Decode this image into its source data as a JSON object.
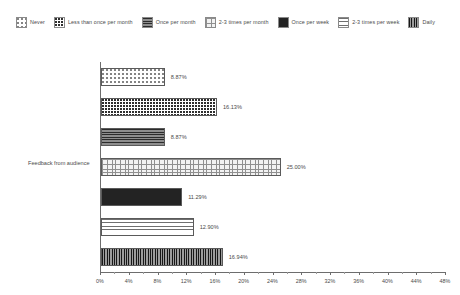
{
  "chart_data": {
    "type": "bar",
    "orientation": "horizontal",
    "title": "",
    "xlabel": "",
    "ylabel": "",
    "categories": [
      "Feedback from audience"
    ],
    "xlim": [
      0,
      48
    ],
    "xticks": [
      "0%",
      "4%",
      "8%",
      "12%",
      "16%",
      "20%",
      "24%",
      "28%",
      "32%",
      "36%",
      "40%",
      "44%",
      "48%"
    ],
    "xtick_values": [
      0,
      4,
      8,
      12,
      16,
      20,
      24,
      28,
      32,
      36,
      40,
      44,
      48
    ],
    "grid": false,
    "legend_position": "top",
    "series": [
      {
        "name": "Never",
        "values": [
          8.87
        ],
        "label": "8.87%",
        "pattern": "sparse-dots"
      },
      {
        "name": "Less than once per month",
        "values": [
          16.13
        ],
        "label": "16.13%",
        "pattern": "dense-dots"
      },
      {
        "name": "Once per month",
        "values": [
          8.87
        ],
        "label": "8.87%",
        "pattern": "dark-horizontal-lines"
      },
      {
        "name": "2-3 times per month",
        "values": [
          25.0
        ],
        "label": "25.00%",
        "pattern": "light-crosshatch"
      },
      {
        "name": "Once per week",
        "values": [
          11.29
        ],
        "label": "11.29%",
        "pattern": "dark-solid-speckle"
      },
      {
        "name": "2-3 times per week",
        "values": [
          12.9
        ],
        "label": "12.90%",
        "pattern": "light-horizontal-lines"
      },
      {
        "name": "Daily",
        "values": [
          16.94
        ],
        "label": "16.94%",
        "pattern": "dark-grid"
      }
    ]
  },
  "legend": {
    "items": [
      {
        "label": "Never",
        "swatch": "sparse-dots-swatch"
      },
      {
        "label": "Less than once per month",
        "swatch": "dense-dots-swatch"
      },
      {
        "label": "Once per month",
        "swatch": "dark-horizontal-lines-swatch"
      },
      {
        "label": "2-3 times per month",
        "swatch": "light-crosshatch-swatch"
      },
      {
        "label": "Once per week",
        "swatch": "dark-solid-speckle-swatch"
      },
      {
        "label": "2-3 times per week",
        "swatch": "light-horizontal-lines-swatch"
      },
      {
        "label": "Daily",
        "swatch": "dark-grid-swatch"
      }
    ]
  },
  "axes": {
    "category_label": "Feedback from audience"
  },
  "colors": {
    "axis": "#6d6d6d",
    "text": "#4a4a4a",
    "background": "#ffffff"
  }
}
